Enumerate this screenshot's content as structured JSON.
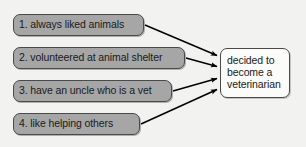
{
  "diagram": {
    "type": "cause-effect",
    "background_color": "#f2f2f0",
    "cause_fill_color": "#a6a6a6",
    "effect_fill_color": "#fbfbf9",
    "border_color": "#4a4a4a",
    "arrow_color": "#000000",
    "causes": [
      {
        "id": 1,
        "label": "1. always liked animals"
      },
      {
        "id": 2,
        "label": "2. volunteered at animal shelter"
      },
      {
        "id": 3,
        "label": "3. have an uncle who is a vet"
      },
      {
        "id": 4,
        "label": "4. like helping others"
      }
    ],
    "effect": {
      "label": "decided to become a veterinarian",
      "line1": "decided to",
      "line2": "become a",
      "line3": "veterinarian"
    },
    "connections": [
      {
        "from": "1. always liked animals",
        "to": "decided to become a veterinarian"
      },
      {
        "from": "2. volunteered at animal shelter",
        "to": "decided to become a veterinarian"
      },
      {
        "from": "3. have an uncle who is a vet",
        "to": "decided to become a veterinarian"
      },
      {
        "from": "4. like helping others",
        "to": "decided to become a veterinarian"
      }
    ]
  }
}
